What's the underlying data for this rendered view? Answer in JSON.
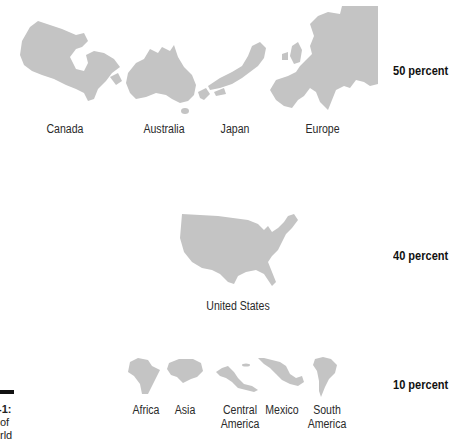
{
  "figure": {
    "caption_fragments": [
      "-1:",
      "of",
      "rld"
    ]
  },
  "tiers": [
    {
      "percent_label": "50 percent",
      "regions": [
        "Canada",
        "Australia",
        "Japan",
        "Europe"
      ]
    },
    {
      "percent_label": "40 percent",
      "regions": [
        "United States"
      ]
    },
    {
      "percent_label": "10 percent",
      "regions": [
        "Africa",
        "Asia",
        "Central\nAmerica",
        "Mexico",
        "South\nAmerica"
      ]
    }
  ],
  "colors": {
    "map_fill": "#c4c4c4",
    "text": "#222222"
  }
}
